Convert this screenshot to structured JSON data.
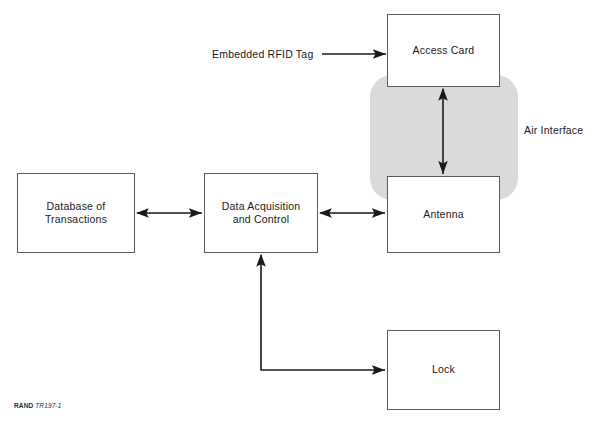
{
  "figure": {
    "width": 602,
    "height": 435,
    "background": "#ffffff",
    "credit": {
      "organization": "RAND",
      "identifier": "TR197-1"
    }
  },
  "colors": {
    "box_fill": "#ffffff",
    "box_border": "#5a5a5a",
    "air_region_fill": "#dadada",
    "arrow": "#1a1a1a",
    "text": "#1a1a1a"
  },
  "nodes": [
    {
      "id": "access-card",
      "label": "Access Card",
      "x": 387,
      "y": 14,
      "width": 113,
      "height": 73
    },
    {
      "id": "antenna",
      "label": "Antenna",
      "x": 387,
      "y": 176,
      "width": 113,
      "height": 77
    },
    {
      "id": "database-of-transactions",
      "label": "Database of\nTransactions",
      "x": 17,
      "y": 173,
      "width": 118,
      "height": 80
    },
    {
      "id": "data-acquisition-and-control",
      "label": "Data Acquisition\nand Control",
      "x": 204,
      "y": 173,
      "width": 114,
      "height": 80
    },
    {
      "id": "lock",
      "label": "Lock",
      "x": 387,
      "y": 330,
      "width": 113,
      "height": 80
    }
  ],
  "regions": [
    {
      "id": "air-interface-region",
      "x": 370,
      "y": 75,
      "width": 148,
      "height": 125,
      "radius": 22
    }
  ],
  "labels": [
    {
      "id": "embedded-rfid-tag",
      "text": "Embedded RFID Tag",
      "x": 212,
      "y": 48
    },
    {
      "id": "air-interface",
      "text": "Air Interface",
      "x": 524,
      "y": 124
    }
  ],
  "connectors": [
    {
      "id": "rfid-tag-to-access-card",
      "from": "embedded-rfid-tag",
      "to": "access-card",
      "arrow_start": false,
      "arrow_end": true,
      "points": "322,54 386,54"
    },
    {
      "id": "access-card-to-antenna",
      "from": "access-card",
      "to": "antenna",
      "arrow_start": true,
      "arrow_end": true,
      "points": "443,89 443,174"
    },
    {
      "id": "database-to-data-acquisition",
      "from": "database-of-transactions",
      "to": "data-acquisition-and-control",
      "arrow_start": true,
      "arrow_end": true,
      "points": "137,213 202,213"
    },
    {
      "id": "data-acquisition-to-antenna",
      "from": "data-acquisition-and-control",
      "to": "antenna",
      "arrow_start": true,
      "arrow_end": true,
      "points": "320,213 385,213"
    },
    {
      "id": "lock-to-data-acquisition",
      "from": "lock",
      "to": "data-acquisition-and-control",
      "arrow_start": true,
      "arrow_end": true,
      "points": "261,255 261,370 385,370"
    }
  ]
}
